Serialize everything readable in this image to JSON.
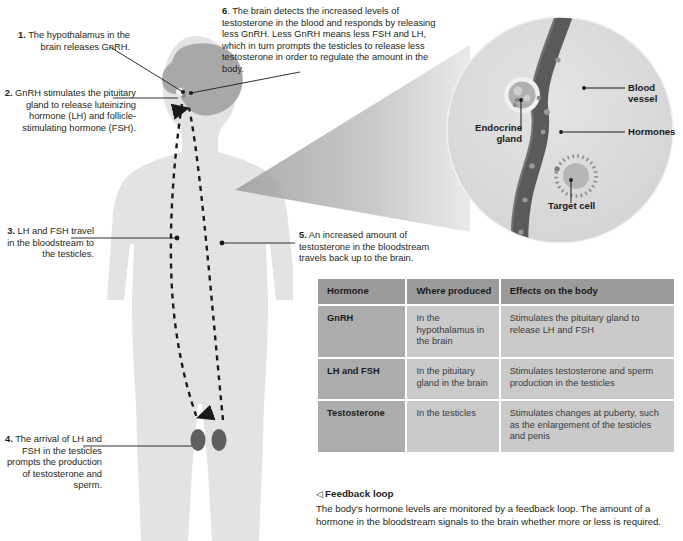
{
  "diagram": {
    "steps": [
      {
        "id": "step-1",
        "number": "1.",
        "text": "The hypothalamus in the brain releases GnRH."
      },
      {
        "id": "step-2",
        "number": "2.",
        "text": "GnRH stimulates the pituitary gland to release luteinizing hormone (LH) and follicle-stimulating hormone (FSH)."
      },
      {
        "id": "step-3",
        "number": "3.",
        "text": "LH and FSH travel in the bloodstream to the testicles."
      },
      {
        "id": "step-4",
        "number": "4.",
        "text": "The arrival of LH and FSH in the testicles prompts the production of testosterone and sperm."
      },
      {
        "id": "step-5",
        "number": "5.",
        "text": "An increased amount of testosterone in the bloodstream travels back up to the brain."
      },
      {
        "id": "step-6",
        "number": "6",
        "text": ". The brain detects the increased levels of testosterone in the blood and responds by releasing less GnRH. Less GnRH means less FSH and LH, which in turn prompts the testicles to release less testosterone in order to regulate the amount in the body."
      }
    ],
    "inset_labels": {
      "blood_vessel": "Blood vessel",
      "hormones": "Hormones",
      "endocrine_gland": "Endocrine\ngland",
      "endocrine_gland_line1": "Endocrine",
      "endocrine_gland_line2": "gland",
      "target_cell": "Target cell"
    }
  },
  "table": {
    "headers": [
      "Hormone",
      "Where produced",
      "Effects on the body"
    ],
    "rows": [
      {
        "hormone": "GnRH",
        "where": "In the hypothalamus in the brain",
        "effects": "Stimulates the pituitary gland to release LH and FSH"
      },
      {
        "hormone": "LH and FSH",
        "where": "In the pituitary gland in the brain",
        "effects": "Stimulates testosterone and sperm production in the testicles"
      },
      {
        "hormone": "Testosterone",
        "where": "In the testicles",
        "effects": "Stimulates changes at puberty, such as the enlargement of the testicles and penis"
      }
    ]
  },
  "caption": {
    "marker": "◁",
    "title": "Feedback loop",
    "body": "The body's hormone levels are monitored by a feedback loop. The amount of a hormone in the bloodstream signals to the brain whether more or less is required."
  },
  "colors": {
    "background": "#ffffff",
    "body_silhouette": "#e3e3e3",
    "brain": "#a8a8a8",
    "vessel": "#5a5a5a",
    "table_header": "#9b9b9b",
    "table_hormone_cell": "#acacac",
    "table_body_cell": "#cacaca",
    "text": "#231f20",
    "inset_circle": "#dcdcdc",
    "cone": "#b4b4b4"
  }
}
